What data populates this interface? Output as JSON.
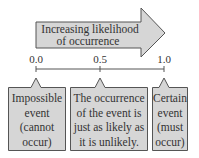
{
  "arrow": {
    "line1": "Increasing likelihood",
    "line2": "of occurrence",
    "fill": "#d6d6d6",
    "stroke": "#555555"
  },
  "scale": {
    "ticks": [
      "0.0",
      "0.5",
      "1.0"
    ]
  },
  "callouts": [
    {
      "lines": [
        "Impossible",
        "event",
        "(cannot",
        "occur)"
      ]
    },
    {
      "lines": [
        "The occurrence",
        "of the event is",
        "just as likely as",
        "it is unlikely."
      ]
    },
    {
      "lines": [
        "Certain",
        "event",
        "(must",
        "occur)"
      ]
    }
  ],
  "colors": {
    "box_fill": "#d6d6d6",
    "box_stroke": "#555555"
  }
}
